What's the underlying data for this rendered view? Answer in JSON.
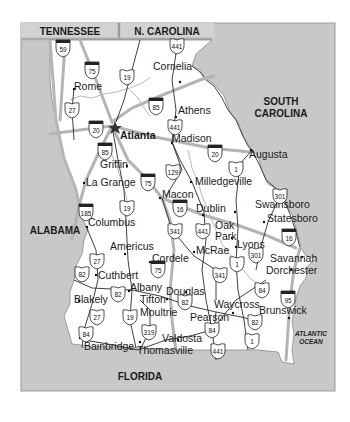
{
  "colors": {
    "background": "#ffffff",
    "neighbor_fill": "#c8c8c8",
    "georgia_fill": "#ffffff",
    "interstate_line": "#b4b4b4",
    "road_line": "#2a2a2a",
    "river_line": "#8a8a8a",
    "border_band": "#a9a9a9",
    "shield_top": "#222222"
  },
  "neighbors": {
    "tennessee": "TENNESSEE",
    "north_carolina": "N. CAROLINA",
    "south_carolina_line1": "SOUTH",
    "south_carolina_line2": "CAROLINA",
    "alabama": "ALABAMA",
    "florida": "FLORIDA",
    "ocean_line1": "ATLANTIC",
    "ocean_line2": "OCEAN"
  },
  "capital": {
    "name": "Atlanta",
    "symbol": "star-icon"
  },
  "cities": [
    {
      "name": "Rome",
      "x": 74,
      "y": 90
    },
    {
      "name": "Cornelia",
      "x": 153,
      "y": 70
    },
    {
      "name": "Athens",
      "x": 178,
      "y": 114
    },
    {
      "name": "Madison",
      "x": 172,
      "y": 142
    },
    {
      "name": "Augusta",
      "x": 249,
      "y": 158
    },
    {
      "name": "Griffin",
      "x": 100,
      "y": 168
    },
    {
      "name": "La Grange",
      "x": 86,
      "y": 186
    },
    {
      "name": "Milledgeville",
      "x": 195,
      "y": 185
    },
    {
      "name": "Macon",
      "x": 162,
      "y": 198
    },
    {
      "name": "Swainsboro",
      "x": 255,
      "y": 208
    },
    {
      "name": "Statesboro",
      "x": 267,
      "y": 222
    },
    {
      "name": "Dublin",
      "x": 196,
      "y": 212
    },
    {
      "name": "Columbus",
      "x": 88,
      "y": 226
    },
    {
      "name": "Oak",
      "x": 215,
      "y": 229
    },
    {
      "name": "Park",
      "x": 215,
      "y": 240
    },
    {
      "name": "Americus",
      "x": 110,
      "y": 250
    },
    {
      "name": "McRae",
      "x": 196,
      "y": 254
    },
    {
      "name": "Lyons",
      "x": 237,
      "y": 248
    },
    {
      "name": "Savannah",
      "x": 270,
      "y": 262
    },
    {
      "name": "Cordele",
      "x": 152,
      "y": 262
    },
    {
      "name": "Dorchester",
      "x": 266,
      "y": 274
    },
    {
      "name": "Cuthbert",
      "x": 98,
      "y": 279
    },
    {
      "name": "Albany",
      "x": 130,
      "y": 291
    },
    {
      "name": "Douglas",
      "x": 166,
      "y": 295
    },
    {
      "name": "Tifton",
      "x": 140,
      "y": 303
    },
    {
      "name": "Blakely",
      "x": 74,
      "y": 303
    },
    {
      "name": "Waycross",
      "x": 214,
      "y": 308
    },
    {
      "name": "Moultrie",
      "x": 140,
      "y": 316
    },
    {
      "name": "Brunswick",
      "x": 259,
      "y": 314
    },
    {
      "name": "Pearson",
      "x": 190,
      "y": 321
    },
    {
      "name": "Valdosta",
      "x": 162,
      "y": 342
    },
    {
      "name": "Bainbridge",
      "x": 84,
      "y": 350
    },
    {
      "name": "Thomasville",
      "x": 137,
      "y": 354
    }
  ],
  "interstates": [
    {
      "num": "59",
      "x": 63,
      "y": 48
    },
    {
      "num": "75",
      "x": 92,
      "y": 70
    },
    {
      "num": "85",
      "x": 156,
      "y": 106
    },
    {
      "num": "20",
      "x": 96,
      "y": 129
    },
    {
      "num": "85",
      "x": 105,
      "y": 151
    },
    {
      "num": "20",
      "x": 215,
      "y": 153
    },
    {
      "num": "75",
      "x": 148,
      "y": 182
    },
    {
      "num": "185",
      "x": 86,
      "y": 212
    },
    {
      "num": "16",
      "x": 180,
      "y": 208
    },
    {
      "num": "16",
      "x": 289,
      "y": 237
    },
    {
      "name_hint": "",
      "num": "75",
      "x": 158,
      "y": 269
    },
    {
      "num": "95",
      "x": 288,
      "y": 299
    }
  ],
  "us_routes": [
    {
      "num": "441",
      "x": 177,
      "y": 46
    },
    {
      "num": "19",
      "x": 127,
      "y": 77
    },
    {
      "num": "27",
      "x": 72,
      "y": 110
    },
    {
      "num": "441",
      "x": 175,
      "y": 127
    },
    {
      "num": "1",
      "x": 236,
      "y": 169
    },
    {
      "num": "129",
      "x": 173,
      "y": 172
    },
    {
      "num": "301",
      "x": 280,
      "y": 196
    },
    {
      "num": "19",
      "x": 127,
      "y": 208
    },
    {
      "num": "341",
      "x": 175,
      "y": 231
    },
    {
      "num": "441",
      "x": 203,
      "y": 231
    },
    {
      "num": "27",
      "x": 97,
      "y": 261
    },
    {
      "num": "82",
      "x": 82,
      "y": 274
    },
    {
      "num": "301",
      "x": 256,
      "y": 255
    },
    {
      "name_hint": "",
      "num": "1",
      "x": 237,
      "y": 264
    },
    {
      "num": "341",
      "x": 220,
      "y": 275
    },
    {
      "num": "84",
      "x": 262,
      "y": 290
    },
    {
      "num": "82",
      "x": 118,
      "y": 294
    },
    {
      "num": "82",
      "x": 185,
      "y": 302
    },
    {
      "num": "27",
      "x": 97,
      "y": 317
    },
    {
      "num": "19",
      "x": 130,
      "y": 317
    },
    {
      "num": "82",
      "x": 255,
      "y": 322
    },
    {
      "num": "84",
      "x": 86,
      "y": 334
    },
    {
      "num": "319",
      "x": 149,
      "y": 332
    },
    {
      "num": "84",
      "x": 212,
      "y": 330
    },
    {
      "num": "1",
      "x": 252,
      "y": 341
    },
    {
      "num": "441",
      "x": 218,
      "y": 351
    }
  ]
}
